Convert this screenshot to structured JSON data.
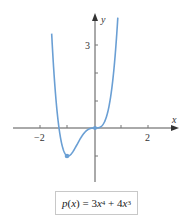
{
  "chart_data": {
    "type": "line",
    "title": "",
    "xlabel": "x",
    "ylabel": "y",
    "function": "p(x) = 3x^4 + 4x^3",
    "xlim": [
      -2.5,
      2.7
    ],
    "ylim": [
      -2.8,
      4.1
    ],
    "x_ticks": [
      -2,
      -1,
      1,
      2
    ],
    "x_tick_labels": [
      "−2",
      "2"
    ],
    "y_ticks": [
      -1,
      1,
      2,
      3
    ],
    "y_tick_labels": [
      "3"
    ],
    "grid": false,
    "series": [
      {
        "name": "p(x) = 3x^4 + 4x^3",
        "color": "#6a9fd4",
        "x": [
          -1.6,
          -1.5,
          -1.4,
          -1.3,
          -1.2,
          -1.1,
          -1.0,
          -0.9,
          -0.8,
          -0.7,
          -0.6,
          -0.5,
          -0.4,
          -0.3,
          -0.2,
          -0.1,
          0,
          0.1,
          0.2,
          0.3,
          0.4,
          0.5,
          0.6,
          0.7,
          0.8,
          0.85
        ],
        "values": [
          3.28,
          1.69,
          0.55,
          -0.22,
          -0.69,
          -0.93,
          -1.0,
          -0.95,
          -0.82,
          -0.65,
          -0.47,
          -0.31,
          -0.18,
          -0.08,
          -0.03,
          0.0,
          0,
          0.0,
          0.04,
          0.13,
          0.33,
          0.69,
          1.25,
          2.09,
          3.28,
          4.03
        ]
      }
    ],
    "marked_points": [
      {
        "x": -1,
        "y": -1,
        "label": "local minimum"
      },
      {
        "x": 0,
        "y": 0,
        "label": "inflection point"
      }
    ]
  },
  "labels": {
    "x_axis": "x",
    "y_axis": "y",
    "x_tick_neg2": "−2",
    "x_tick_2": "2",
    "y_tick_3": "3"
  },
  "formula": {
    "lhs": "p",
    "arg": "x",
    "rhs_coef1": "3",
    "rhs_var1": "x",
    "rhs_exp1": "4",
    "op": "+",
    "rhs_coef2": "4",
    "rhs_var2": "x",
    "rhs_exp2": "3"
  },
  "colors": {
    "curve": "#6a9fd4",
    "axis": "#555555",
    "point": "#6a9fd4"
  }
}
